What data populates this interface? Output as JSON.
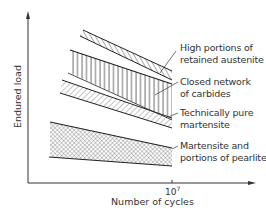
{
  "diagram": {
    "type": "endurance-load-vs-cycles",
    "axes": {
      "y_label": "Endured load",
      "x_label": "Number of cycles",
      "x_tick": {
        "base": "10",
        "exponent": "7"
      }
    },
    "bands": [
      {
        "id": "retained-austenite",
        "label_line1": "High portions of",
        "label_line2": "retained austenite",
        "hatch": "diagonal"
      },
      {
        "id": "carbides",
        "label_line1": "Closed network",
        "label_line2": "of carbides",
        "hatch": "vertical"
      },
      {
        "id": "pure-martensite",
        "label_line1": "Technically pure",
        "label_line2": "martensite",
        "hatch": "diagonal-reverse"
      },
      {
        "id": "martensite-pearlite",
        "label_line1": "Martensite and",
        "label_line2": "portions of pearlite",
        "hatch": "crosshatch"
      }
    ],
    "colors": {
      "line": "#2a2a2a",
      "hatch": "#444444",
      "text": "#333333",
      "background": "#ffffff"
    }
  }
}
